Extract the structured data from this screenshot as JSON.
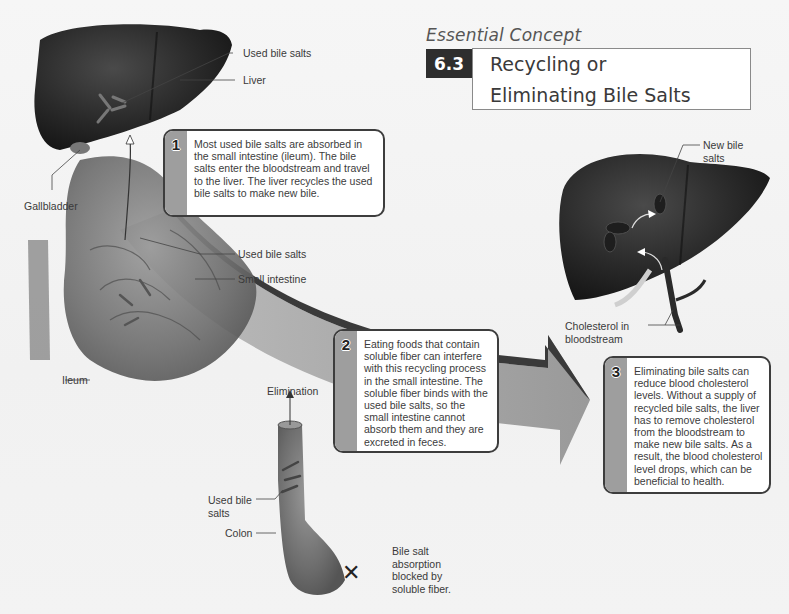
{
  "header": {
    "eyebrow": "Essential Concept",
    "number": "6.3",
    "title_line1": "Recycling or",
    "title_line2": "Eliminating Bile Salts"
  },
  "callouts": [
    {
      "number": "1",
      "text": "Most used bile salts are absorbed in the small intestine (ileum). The bile salts enter the bloodstream and travel to the liver. The liver recycles the used bile salts to make new bile."
    },
    {
      "number": "2",
      "text": "Eating foods that contain soluble fiber can interfere with this recycling process in the small intestine. The soluble fiber binds with the used bile salts, so the small intestine cannot absorb them and they are excreted in feces."
    },
    {
      "number": "3",
      "text": "Eliminating bile salts can reduce blood cholesterol levels. Without a supply of recycled bile salts, the liver has to remove cholesterol from the bloodstream to make new bile salts.  As a result, the blood cholesterol level drops, which can be beneficial to health."
    }
  ],
  "labels": {
    "used_bile_salts_top": "Used bile salts",
    "liver": "Liver",
    "gallbladder": "Gallbladder",
    "used_bile_salts_mid": "Used bile salts",
    "small_intestine": "Small intestine",
    "ileum": "Ileum",
    "elimination": "Elimination",
    "used_bile_salts_colon_1": "Used bile",
    "used_bile_salts_colon_2": "salts",
    "colon": "Colon",
    "blocked_1": "Bile salt",
    "blocked_2": "absorption",
    "blocked_3": "blocked by",
    "blocked_4": "soluble fiber.",
    "new_bile_salts_1": "New bile",
    "new_bile_salts_2": "salts",
    "cholesterol_1": "Cholesterol in",
    "cholesterol_2": "bloodstream"
  },
  "colors": {
    "organ_dark": "#2a2a2a",
    "intestine": "#7a7a7a",
    "arrow_dark": "#3a3a3a",
    "arrow_light": "#8c8c8c",
    "callout_border": "#3d3d3d",
    "callout_strip": "#9e9e9e",
    "title_badge": "#2e2e2e"
  }
}
